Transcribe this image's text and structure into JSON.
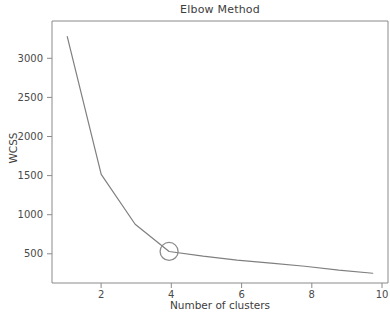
{
  "chart_data": {
    "type": "line",
    "title": "Elbow Method",
    "xlabel": "Number of clusters",
    "ylabel": "WCSS",
    "x": [
      1,
      2,
      3,
      4,
      5,
      6,
      7,
      8,
      9,
      10
    ],
    "values": [
      3320,
      1550,
      910,
      560,
      500,
      450,
      410,
      370,
      320,
      280
    ],
    "series": [
      {
        "name": "WCSS",
        "values": [
          3320,
          1550,
          910,
          560,
          500,
          450,
          410,
          370,
          320,
          280
        ]
      }
    ],
    "xlim": [
      0.55,
      10.45
    ],
    "ylim": [
      155,
      3520
    ],
    "xticks": [
      2,
      4,
      6,
      8,
      10
    ],
    "xtick_labels": [
      "2",
      "4",
      "6",
      "8",
      "10"
    ],
    "yticks": [
      500,
      1000,
      1500,
      2000,
      2500,
      3000
    ],
    "ytick_labels": [
      "500",
      "1000",
      "1500",
      "2000",
      "2500",
      "3000"
    ],
    "grid": false,
    "legend": false,
    "line_color": "#7f7f7f",
    "annotations": [
      {
        "kind": "circle-marker",
        "label": "elbow-point",
        "x": 4,
        "y": 560,
        "color": "#8c8c8c",
        "filled": false
      }
    ]
  },
  "figure": {
    "background": "#ffffff",
    "axis_color": "#8a8a8a",
    "text_color": "#3d3d3d"
  }
}
